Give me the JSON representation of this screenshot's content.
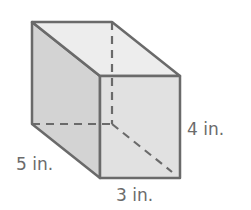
{
  "figure": {
    "type": "rectangular-prism",
    "dimensions": {
      "length": {
        "value": 5,
        "unit": "in.",
        "label": "5 in."
      },
      "width": {
        "value": 3,
        "unit": "in.",
        "label": "3 in."
      },
      "height": {
        "value": 4,
        "unit": "in.",
        "label": "4 in."
      }
    },
    "colors": {
      "edge": "#6a6a6a",
      "left_face": "#d3d3d3",
      "top_face": "#ededed",
      "front_face": "#e1e1e1",
      "label_text": "#6b6b6b"
    }
  }
}
